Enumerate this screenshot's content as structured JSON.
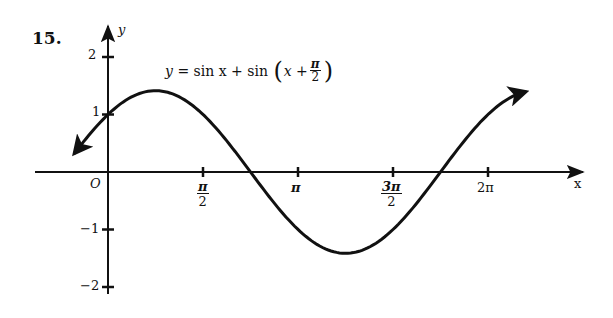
{
  "problem": {
    "number": "15."
  },
  "chart_data": {
    "type": "line",
    "title_parts": {
      "lhs": "y",
      "eq": "=",
      "term1": "sin x",
      "plus": "+",
      "term2_fn": "sin",
      "inner_x": "x",
      "inner_plus": "+",
      "frac_num": "π",
      "frac_den": "2"
    },
    "xlabel": "x",
    "ylabel": "y",
    "origin_label": "O",
    "x_ticks": [
      {
        "value": 1.5708,
        "num": "π",
        "den": "2"
      },
      {
        "value": 3.1416,
        "label": "π"
      },
      {
        "value": 4.7124,
        "num": "3π",
        "den": "2"
      },
      {
        "value": 6.2832,
        "label": "2π"
      }
    ],
    "y_ticks": [
      {
        "value": 2,
        "label": "2"
      },
      {
        "value": 1,
        "label": "1"
      },
      {
        "value": -1,
        "label": "−1"
      },
      {
        "value": -2,
        "label": "−2"
      }
    ],
    "xlim": [
      -0.6,
      7.4
    ],
    "ylim": [
      -2.3,
      2.4
    ],
    "grid": false,
    "legend": "none",
    "series": [
      {
        "name": "y = sin x + sin(x + π/2)",
        "x_start": -0.55,
        "x_end": 6.9,
        "arrows": "both",
        "points": [
          {
            "x": -0.55,
            "y": 0.33
          },
          {
            "x": 0,
            "y": 1.0
          },
          {
            "x": 0.7854,
            "y": 1.414
          },
          {
            "x": 1.5708,
            "y": 1.0
          },
          {
            "x": 2.3562,
            "y": 0.0
          },
          {
            "x": 3.1416,
            "y": -1.0
          },
          {
            "x": 3.927,
            "y": -1.414
          },
          {
            "x": 4.7124,
            "y": -1.0
          },
          {
            "x": 5.4978,
            "y": 0.0
          },
          {
            "x": 6.2832,
            "y": 1.0
          },
          {
            "x": 6.9,
            "y": 1.33
          }
        ]
      }
    ],
    "annotations": [
      {
        "text": "max ≈ √2 at x = π/4"
      },
      {
        "text": "min ≈ −√2 at x = 5π/4"
      }
    ]
  },
  "style": {
    "ink": "#111111",
    "background": "#ffffff"
  }
}
